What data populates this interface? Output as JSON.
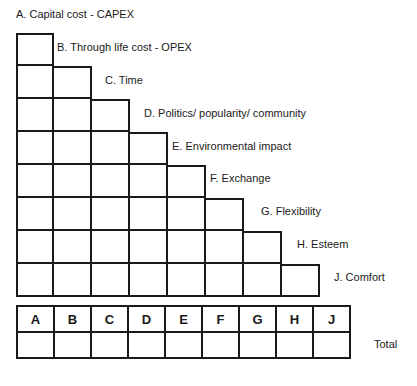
{
  "diagram": {
    "criteria": [
      {
        "key": "A",
        "label": "A. Capital cost - CAPEX"
      },
      {
        "key": "B",
        "label": "B. Through life cost - OPEX"
      },
      {
        "key": "C",
        "label": "C. Time"
      },
      {
        "key": "D",
        "label": "D. Politics/ popularity/ community"
      },
      {
        "key": "E",
        "label": "E. Environmental impact"
      },
      {
        "key": "F",
        "label": "F. Exchange"
      },
      {
        "key": "G",
        "label": "G. Flexibility"
      },
      {
        "key": "H",
        "label": "H. Esteem"
      },
      {
        "key": "J",
        "label": "J. Comfort"
      }
    ],
    "matrix": {
      "rows": [
        1,
        2,
        3,
        4,
        5,
        6,
        7,
        8
      ],
      "cell_values": [
        [
          ""
        ],
        [
          "",
          ""
        ],
        [
          "",
          "",
          ""
        ],
        [
          "",
          "",
          "",
          ""
        ],
        [
          "",
          "",
          "",
          "",
          ""
        ],
        [
          "",
          "",
          "",
          "",
          "",
          ""
        ],
        [
          "",
          "",
          "",
          "",
          "",
          "",
          ""
        ],
        [
          "",
          "",
          "",
          "",
          "",
          "",
          "",
          ""
        ]
      ]
    },
    "totals_table": {
      "headers": [
        "A",
        "B",
        "C",
        "D",
        "E",
        "F",
        "G",
        "H",
        "J"
      ],
      "values": [
        "",
        "",
        "",
        "",
        "",
        "",
        "",
        "",
        ""
      ],
      "row_label": "Total"
    },
    "colors": {
      "line": "#1a1a1a",
      "background": "#ffffff",
      "text": "#1a1a1a"
    }
  }
}
